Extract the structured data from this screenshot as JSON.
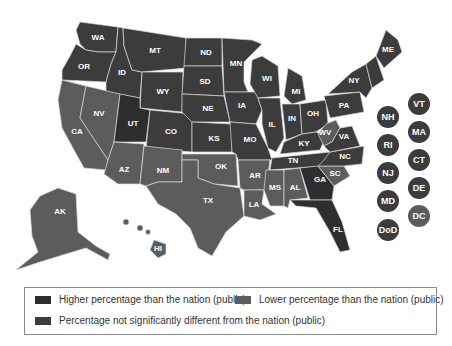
{
  "colors": {
    "higher": "#2e2e2e",
    "not_significant": "#3c3c3c",
    "lower": "#5c5c5c",
    "border": "#d8d8d8"
  },
  "legend": {
    "higher": "Higher percentage than the nation (public)",
    "lower": "Lower percentage than the nation (public)",
    "not_significant": "Percentage not significantly different from the nation (public)"
  },
  "states": [
    {
      "id": "WA",
      "cat": "not_significant"
    },
    {
      "id": "OR",
      "cat": "not_significant"
    },
    {
      "id": "ID",
      "cat": "not_significant"
    },
    {
      "id": "MT",
      "cat": "not_significant"
    },
    {
      "id": "ND",
      "cat": "not_significant"
    },
    {
      "id": "MN",
      "cat": "not_significant"
    },
    {
      "id": "WI",
      "cat": "not_significant"
    },
    {
      "id": "MI",
      "cat": "not_significant"
    },
    {
      "id": "ME",
      "cat": "not_significant"
    },
    {
      "id": "SD",
      "cat": "not_significant"
    },
    {
      "id": "WY",
      "cat": "not_significant"
    },
    {
      "id": "NE",
      "cat": "not_significant"
    },
    {
      "id": "IA",
      "cat": "not_significant"
    },
    {
      "id": "NY",
      "cat": "not_significant"
    },
    {
      "id": "PA",
      "cat": "not_significant"
    },
    {
      "id": "IL",
      "cat": "not_significant"
    },
    {
      "id": "IN",
      "cat": "not_significant"
    },
    {
      "id": "OH",
      "cat": "not_significant"
    },
    {
      "id": "UT",
      "cat": "higher"
    },
    {
      "id": "CO",
      "cat": "not_significant"
    },
    {
      "id": "KS",
      "cat": "not_significant"
    },
    {
      "id": "MO",
      "cat": "not_significant"
    },
    {
      "id": "KY",
      "cat": "not_significant"
    },
    {
      "id": "WV",
      "cat": "lower"
    },
    {
      "id": "VA",
      "cat": "not_significant"
    },
    {
      "id": "NC",
      "cat": "not_significant"
    },
    {
      "id": "TN",
      "cat": "not_significant"
    },
    {
      "id": "SC",
      "cat": "lower"
    },
    {
      "id": "GA",
      "cat": "higher"
    },
    {
      "id": "FL",
      "cat": "higher"
    },
    {
      "id": "CA",
      "cat": "lower"
    },
    {
      "id": "NV",
      "cat": "lower"
    },
    {
      "id": "AZ",
      "cat": "lower"
    },
    {
      "id": "NM",
      "cat": "lower"
    },
    {
      "id": "OK",
      "cat": "lower"
    },
    {
      "id": "TX",
      "cat": "lower"
    },
    {
      "id": "AR",
      "cat": "lower"
    },
    {
      "id": "LA",
      "cat": "lower"
    },
    {
      "id": "MS",
      "cat": "lower"
    },
    {
      "id": "AL",
      "cat": "lower"
    },
    {
      "id": "AK",
      "cat": "lower"
    },
    {
      "id": "HI",
      "cat": "lower"
    }
  ],
  "circles": [
    {
      "id": "VT",
      "cat": "not_significant"
    },
    {
      "id": "NH",
      "cat": "not_significant"
    },
    {
      "id": "MA",
      "cat": "not_significant"
    },
    {
      "id": "RI",
      "cat": "not_significant"
    },
    {
      "id": "CT",
      "cat": "not_significant"
    },
    {
      "id": "NJ",
      "cat": "not_significant"
    },
    {
      "id": "DE",
      "cat": "not_significant"
    },
    {
      "id": "MD",
      "cat": "not_significant"
    },
    {
      "id": "DC",
      "cat": "lower"
    },
    {
      "id": "DoD",
      "cat": "not_significant"
    }
  ],
  "labels": {
    "WA": "WA",
    "OR": "OR",
    "ID": "ID",
    "MT": "MT",
    "ND": "ND",
    "MN": "MN",
    "WI": "WI",
    "MI": "MI",
    "ME": "ME",
    "SD": "SD",
    "WY": "WY",
    "NE": "NE",
    "IA": "IA",
    "NY": "NY",
    "PA": "PA",
    "IL": "IL",
    "IN": "IN",
    "OH": "OH",
    "UT": "UT",
    "CO": "CO",
    "KS": "KS",
    "MO": "MO",
    "KY": "KY",
    "WV": "WV",
    "VA": "VA",
    "NC": "NC",
    "TN": "TN",
    "SC": "SC",
    "GA": "GA",
    "FL": "FL",
    "CA": "CA",
    "NV": "NV",
    "AZ": "AZ",
    "NM": "NM",
    "OK": "OK",
    "TX": "TX",
    "AR": "AR",
    "LA": "LA",
    "MS": "MS",
    "AL": "AL",
    "AK": "AK",
    "HI": "HI",
    "VT": "VT",
    "NH": "NH",
    "MA": "MA",
    "RI": "RI",
    "CT": "CT",
    "NJ": "NJ",
    "DE": "DE",
    "MD": "MD",
    "DC": "DC",
    "DoD": "DoD"
  }
}
